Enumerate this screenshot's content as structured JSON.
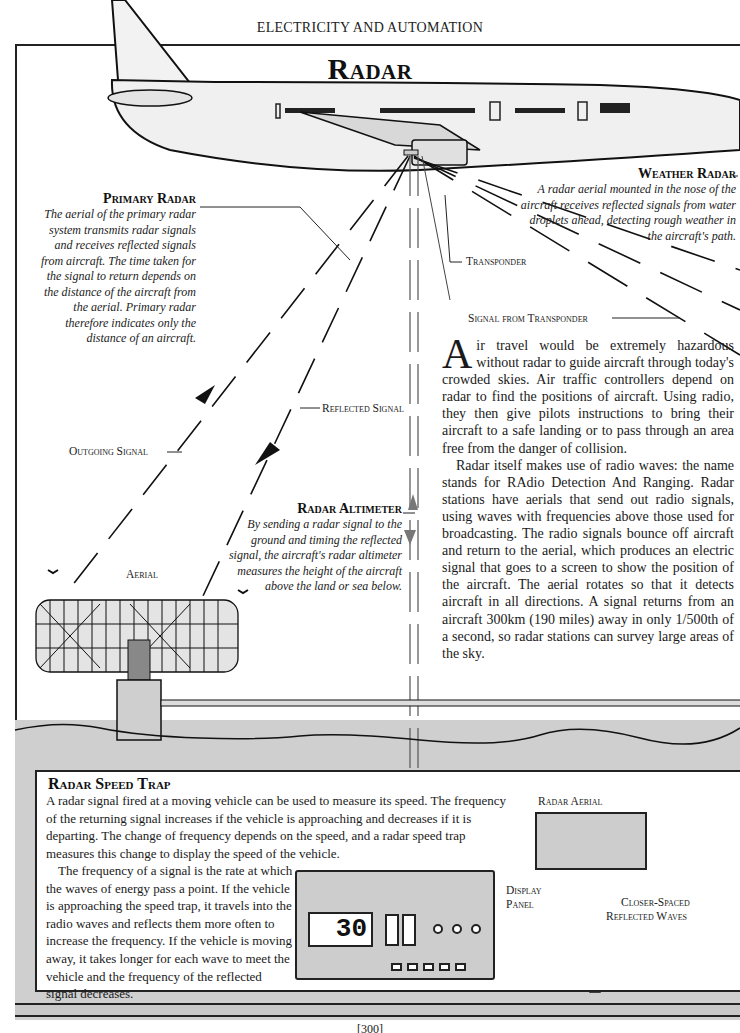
{
  "header": {
    "running_head": "ELECTRICITY AND AUTOMATION",
    "title": "Radar"
  },
  "captions": {
    "primary_radar": {
      "heading": "Primary Radar",
      "text": "The aerial of the primary radar system transmits radar signals and receives reflected signals from aircraft. The time taken for the signal to return depends on the distance of the aircraft from the aerial. Primary radar therefore indicates only the distance of an aircraft."
    },
    "weather_radar": {
      "heading": "Weather Radar",
      "text": "A radar aerial mounted in the nose of the aircraft receives reflected signals from water droplets ahead, detecting rough weather in the aircraft's path."
    },
    "radar_altimeter": {
      "heading": "Radar Altimeter",
      "text": "By sending a radar signal to the ground and timing the reflected signal, the aircraft's radar altimeter measures the height of the aircraft above the land or sea below."
    }
  },
  "labels": {
    "transponder": "Transponder",
    "signal_from_transponder": "Signal from Transponder",
    "reflected_signal": "Reflected Signal",
    "outgoing_signal": "Outgoing Signal",
    "aerial": "Aerial",
    "radar_aerial": "Radar Aerial",
    "display_panel_1": "Display",
    "display_panel_2": "Panel",
    "closer_spaced_1": "Closer-Spaced",
    "closer_spaced_2": "Reflected Waves"
  },
  "body": {
    "dropcap": "A",
    "para1_rest": "ir travel would be extremely hazardous without radar to guide aircraft through today's crowded skies. Air traffic controllers depend on radar to find the positions of aircraft. Using radio, they then give pilots instructions to bring their aircraft to a safe landing or to pass through an area free from the danger of collision.",
    "para2": "Radar itself makes use of radio waves: the name stands for RAdio Detection And Ranging. Radar stations have aerials that send out radio signals, using waves with frequencies above those used for broadcasting. The radio signals bounce off aircraft and return to the aerial, which produces an electric signal that goes to a screen to show the position of the aircraft. The aerial rotates so that it detects aircraft in all directions. A signal returns from an aircraft 300km (190 miles) away in only 1/500th of a second, so radar stations can survey large areas of the sky."
  },
  "speed_trap": {
    "heading": "Radar Speed Trap",
    "para1": "A radar signal fired at a moving vehicle can be used to measure its speed. The frequency of the returning signal increases if the vehicle is approaching and decreases if it is departing. The change of frequency depends on the speed, and a radar speed trap measures this change to display the speed of the vehicle.",
    "para2": "The frequency of a signal is the rate at which the waves of energy pass a point. If the vehicle is approaching the speed trap, it travels into the radio waves and reflects them more often to increase the frequency. If the vehicle is moving away, it takes longer for each wave to meet the vehicle and the frequency of the reflected signal decreases.",
    "display_reading": "30"
  },
  "footer": {
    "page_number": "[300]"
  },
  "colors": {
    "ink": "#1a1a1a",
    "ground_gray": "#cfcfcf",
    "panel_gray": "#cdcdcd",
    "paper": "#ffffff"
  }
}
